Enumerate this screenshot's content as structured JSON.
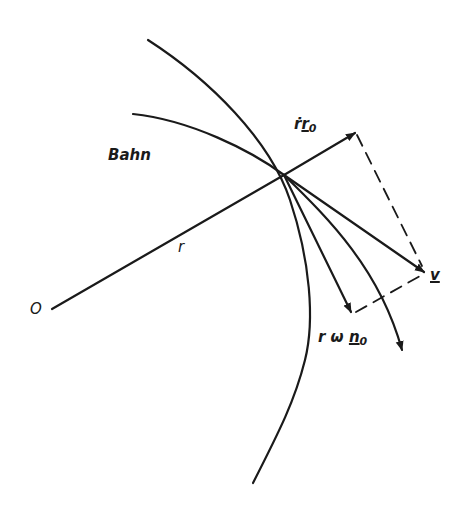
{
  "diagram": {
    "stroke_color": "#1a1a1a",
    "background": "#ffffff",
    "labels": {
      "orbit": "Bahn",
      "origin": "O",
      "radius": "r",
      "radial_velocity": {
        "prefix": "ṙ",
        "vector": "r",
        "subscript": "0"
      },
      "tangential_velocity": {
        "prefix": "r ω ",
        "vector": "n",
        "subscript": "0"
      },
      "velocity": "v"
    },
    "elements": [
      "orbit curve (Bahn)",
      "circle arc of radius r about O",
      "radius line from O through point",
      "radial velocity vector ṙ r0",
      "tangential velocity vector r ω n0",
      "resultant velocity vector v",
      "tangent arrow along orbit",
      "dashed parallelogram lines"
    ]
  }
}
